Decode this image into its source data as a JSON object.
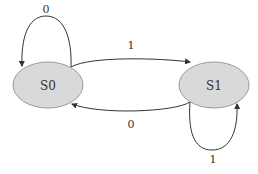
{
  "diagram": {
    "type": "state-machine",
    "states": [
      {
        "id": "S0",
        "label": "S0"
      },
      {
        "id": "S1",
        "label": "S1"
      }
    ],
    "transitions": [
      {
        "from": "S0",
        "to": "S0",
        "label": "0"
      },
      {
        "from": "S0",
        "to": "S1",
        "label": "1"
      },
      {
        "from": "S1",
        "to": "S0",
        "label": "0"
      },
      {
        "from": "S1",
        "to": "S1",
        "label": "1"
      }
    ],
    "colors": {
      "state_fill": "#d9d9d9",
      "state_stroke": "#9a9a9a",
      "edge": "#333333"
    }
  }
}
